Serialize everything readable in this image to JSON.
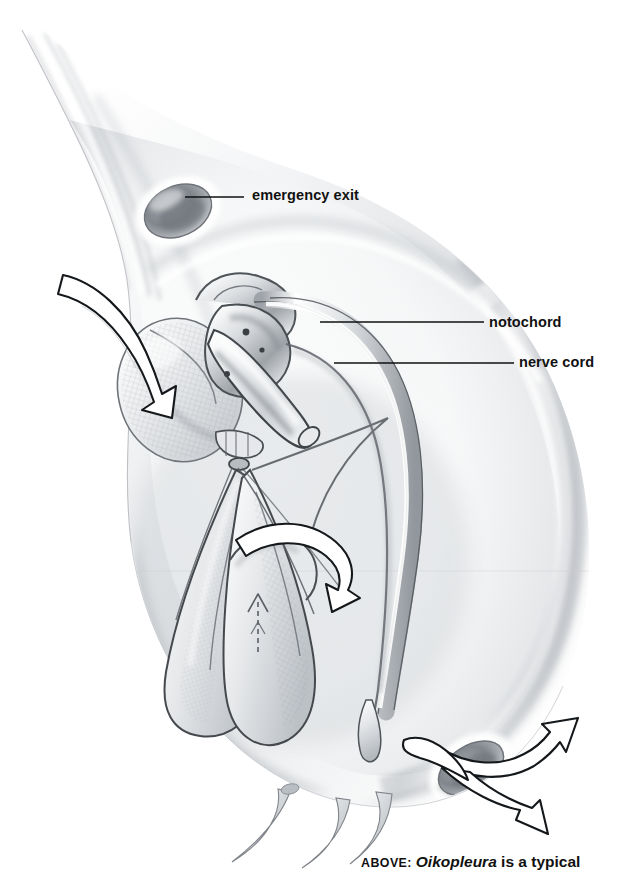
{
  "figure": {
    "medium": "graphite pencil scientific illustration",
    "background_color": "#ffffff",
    "ink_color": "#111111",
    "shading_colors": {
      "mid_gray": "#b9bcc0",
      "light_gray": "#dcdee1",
      "deep_gray": "#7d8186",
      "shadow_gray": "#5a5e63",
      "paper": "#ffffff"
    }
  },
  "callouts": [
    {
      "id": "emergency-exit",
      "label": "emergency exit",
      "leader": {
        "x1": 185,
        "y1": 197,
        "x2": 244,
        "y2": 197
      }
    },
    {
      "id": "notochord",
      "label": "notochord",
      "leader": {
        "x1": 320,
        "y1": 322,
        "x2": 484,
        "y2": 322
      }
    },
    {
      "id": "nerve-cord",
      "label": "nerve cord",
      "leader": {
        "x1": 334,
        "y1": 363,
        "x2": 514,
        "y2": 363
      }
    }
  ],
  "caption": {
    "lead_in": "ABOVE:",
    "genus": "Oikopleura",
    "rest": " is a typical"
  },
  "flow_arrows": [
    {
      "id": "inflow-arrow",
      "role": "water entering the incurrent filter",
      "direction": "down-right"
    },
    {
      "id": "internal-flow-arrow",
      "role": "water passing through the feeding filter",
      "direction": "right"
    },
    {
      "id": "filter-up-arrow",
      "role": "small dashed arrow inside the food-concentrating filter",
      "direction": "up"
    },
    {
      "id": "outflow-arrow-upper",
      "role": "water exiting the escape chamber",
      "direction": "up-right"
    },
    {
      "id": "outflow-arrow-lower",
      "role": "water exiting the escape chamber",
      "direction": "down-right"
    }
  ]
}
